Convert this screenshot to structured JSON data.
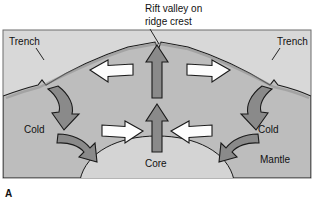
{
  "figure": {
    "panel_letter": "A",
    "caption_title": {
      "line1": "Rift valley on",
      "line2": "ridge crest"
    },
    "labels": {
      "trench_left": "Trench",
      "trench_right": "Trench",
      "cold_left": "Cold",
      "cold_right": "Cold",
      "mantle": "Mantle",
      "core": "Core"
    },
    "colors": {
      "mantle_fill": "#bdbdbd",
      "core_fill": "#d4d4d4",
      "background": "#d8d8d8",
      "dark_arrow_fill": "#8a8a8a",
      "white_arrow_fill": "#fdfdfd",
      "outline": "#1a1a1a",
      "text": "#111111"
    },
    "arrows": [
      {
        "name": "upwelling-arrow-upper",
        "direction": "up",
        "style": "dark",
        "meaning": "hot mantle rising to ridge crest"
      },
      {
        "name": "upwelling-arrow-lower",
        "direction": "up",
        "style": "dark",
        "meaning": "hot mantle rising from core boundary"
      },
      {
        "name": "spreading-arrow-left",
        "direction": "left",
        "style": "white",
        "meaning": "seafloor spreading away from ridge"
      },
      {
        "name": "spreading-arrow-right",
        "direction": "right",
        "style": "white",
        "meaning": "seafloor spreading away from ridge"
      },
      {
        "name": "downwelling-arrow-left",
        "direction": "down-left",
        "style": "dark-curved",
        "meaning": "cold slab sinking at trench"
      },
      {
        "name": "downwelling-arrow-right",
        "direction": "down-right",
        "style": "dark-curved",
        "meaning": "cold slab sinking at trench"
      },
      {
        "name": "return-flow-arrow-left",
        "direction": "down-right",
        "style": "dark-curved",
        "meaning": "return flow toward core"
      },
      {
        "name": "return-flow-arrow-right",
        "direction": "left",
        "style": "dark-curved",
        "meaning": "return flow toward core"
      },
      {
        "name": "inflow-arrow-left",
        "direction": "right",
        "style": "white",
        "meaning": "deep flow toward rising limb"
      },
      {
        "name": "inflow-arrow-right",
        "direction": "left",
        "style": "white",
        "meaning": "deep flow toward rising limb"
      }
    ]
  }
}
